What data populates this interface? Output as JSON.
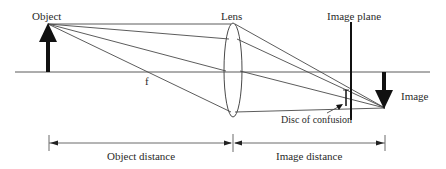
{
  "diagram": {
    "labels": {
      "object": "Object",
      "lens": "Lens",
      "image_plane": "Image plane",
      "image": "Image",
      "focal_point": "f",
      "disc_of_confusion": "Disc of confusion",
      "object_distance": "Object distance",
      "image_distance": "Image distance"
    },
    "colors": {
      "line": "#4a4a4a",
      "arrow": "#111111",
      "text": "#2a2a2a",
      "background": "#ffffff"
    },
    "geometry": {
      "optical_axis_y": 72,
      "object_x": 48,
      "object_top_y": 24,
      "lens_x": 233,
      "lens_half_height": 47,
      "image_plane_x": 351,
      "image_point": [
        385,
        108
      ],
      "focal_point_x": 143
    }
  }
}
